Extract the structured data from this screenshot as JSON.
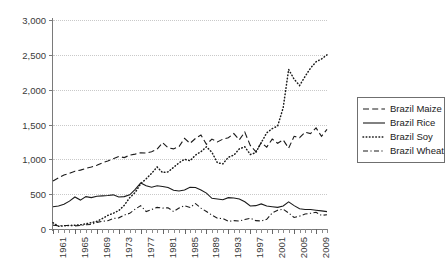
{
  "chart_data": {
    "type": "line",
    "title": "",
    "xlabel": "",
    "ylabel": "",
    "ylim": [
      0,
      3000
    ],
    "xlim": [
      1961,
      2011
    ],
    "grid": "horizontal-dotted",
    "legend_position": "right",
    "y_ticks": [
      "0",
      "500",
      "1,000",
      "1,500",
      "2,000",
      "2,500",
      "3,000"
    ],
    "y_tick_values": [
      0,
      500,
      1000,
      1500,
      2000,
      2500,
      3000
    ],
    "x_tick_labels": [
      "1961",
      "1965",
      "1969",
      "1973",
      "1977",
      "1981",
      "1985",
      "1989",
      "1993",
      "1997",
      "2001",
      "2005",
      "2009"
    ],
    "x": [
      1961,
      1962,
      1963,
      1964,
      1965,
      1966,
      1967,
      1968,
      1969,
      1970,
      1971,
      1972,
      1973,
      1974,
      1975,
      1976,
      1977,
      1978,
      1979,
      1980,
      1981,
      1982,
      1983,
      1984,
      1985,
      1986,
      1987,
      1988,
      1989,
      1990,
      1991,
      1992,
      1993,
      1994,
      1995,
      1996,
      1997,
      1998,
      1999,
      2000,
      2001,
      2002,
      2003,
      2004,
      2005,
      2006,
      2007,
      2008,
      2009,
      2010,
      2011
    ],
    "series": [
      {
        "name": "Brazil Maize",
        "style": "dashed",
        "values": [
          690,
          735,
          775,
          800,
          830,
          845,
          870,
          890,
          915,
          950,
          975,
          1010,
          1040,
          1025,
          1060,
          1075,
          1095,
          1090,
          1110,
          1145,
          1240,
          1165,
          1150,
          1185,
          1300,
          1230,
          1300,
          1350,
          1215,
          1290,
          1250,
          1290,
          1310,
          1370,
          1280,
          1390,
          1200,
          1110,
          1240,
          1175,
          1290,
          1230,
          1280,
          1160,
          1330,
          1310,
          1390,
          1370,
          1450,
          1330,
          1430
        ]
      },
      {
        "name": "Brazil Rice",
        "style": "solid",
        "values": [
          320,
          330,
          355,
          400,
          460,
          415,
          465,
          450,
          470,
          475,
          480,
          490,
          460,
          465,
          490,
          570,
          660,
          620,
          600,
          620,
          610,
          595,
          555,
          545,
          560,
          600,
          595,
          560,
          515,
          440,
          430,
          420,
          450,
          445,
          430,
          390,
          330,
          335,
          360,
          330,
          320,
          310,
          330,
          390,
          335,
          290,
          280,
          280,
          270,
          260,
          250
        ]
      },
      {
        "name": "Brazil Soy",
        "style": "dotted",
        "values": [
          90,
          40,
          45,
          50,
          55,
          60,
          75,
          90,
          110,
          150,
          195,
          225,
          265,
          340,
          450,
          525,
          650,
          720,
          800,
          890,
          810,
          820,
          885,
          950,
          1000,
          980,
          1060,
          1110,
          1180,
          1100,
          950,
          935,
          1030,
          1060,
          1150,
          1180,
          1070,
          1095,
          1240,
          1380,
          1440,
          1480,
          1740,
          2290,
          2150,
          2060,
          2190,
          2310,
          2400,
          2440,
          2500
        ]
      },
      {
        "name": "Brazil Wheat",
        "style": "dash-dot",
        "values": [
          55,
          45,
          50,
          50,
          45,
          50,
          60,
          65,
          95,
          110,
          120,
          150,
          160,
          200,
          225,
          285,
          335,
          250,
          280,
          310,
          300,
          305,
          250,
          300,
          335,
          310,
          365,
          300,
          250,
          200,
          155,
          150,
          110,
          120,
          115,
          135,
          155,
          120,
          115,
          140,
          230,
          270,
          285,
          230,
          165,
          185,
          215,
          225,
          240,
          195,
          205
        ]
      }
    ]
  },
  "legend": {
    "items": [
      {
        "label": "Brazil Maize",
        "style": "dashed"
      },
      {
        "label": "Brazil Rice",
        "style": "solid"
      },
      {
        "label": "Brazil Soy",
        "style": "dotted"
      },
      {
        "label": "Brazil Wheat",
        "style": "dash-dot"
      }
    ]
  }
}
